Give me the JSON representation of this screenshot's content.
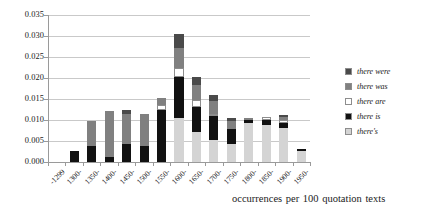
{
  "chart_data": {
    "type": "bar",
    "subtype": "stacked-bar",
    "title": "",
    "xlabel": "occurrences per 100 quotation texts",
    "ylabel": "",
    "ylim": [
      0.0,
      0.035
    ],
    "ytick_labels": [
      "0.035",
      "0.030",
      "0.025",
      "0.020",
      "0.015",
      "0.010",
      "0.005",
      "0.000"
    ],
    "ytick_values": [
      0.035,
      0.03,
      0.025,
      0.02,
      0.015,
      0.01,
      0.005,
      0.0
    ],
    "grid": true,
    "legend_position": "right",
    "categories": [
      "-1299",
      "1300-",
      "1350-",
      "1400-",
      "1450-",
      "1500-",
      "1550-",
      "1600-",
      "1650-",
      "1700-",
      "1750-",
      "1800-",
      "1850-",
      "1900-",
      "1950-"
    ],
    "series": [
      {
        "name": "there's",
        "color": "#d4d4d4",
        "values": [
          0.0,
          0.0,
          0.0,
          0.0,
          0.0,
          0.0,
          0.0,
          0.0105,
          0.0072,
          0.0052,
          0.0043,
          0.0092,
          0.0088,
          0.0082,
          0.0026
        ]
      },
      {
        "name": "there is",
        "color": "#111111",
        "values": [
          0.0,
          0.0026,
          0.0038,
          0.0013,
          0.0042,
          0.0039,
          0.0125,
          0.0097,
          0.006,
          0.0057,
          0.0036,
          0.0009,
          0.0012,
          0.0012,
          0.0004
        ]
      },
      {
        "name": "there are",
        "color": "#ffffff",
        "values": [
          0.0,
          0.0,
          0.0,
          0.0,
          0.0,
          0.0,
          0.0011,
          0.0021,
          0.0015,
          0.0005,
          0.0,
          0.0,
          0.0008,
          0.0006,
          0.0
        ]
      },
      {
        "name": "there was",
        "color": "#808080",
        "values": [
          0.0,
          0.0,
          0.006,
          0.0109,
          0.0072,
          0.0075,
          0.0016,
          0.0048,
          0.0036,
          0.0032,
          0.0019,
          0.0005,
          0.0,
          0.0008,
          0.0002
        ]
      },
      {
        "name": "there were",
        "color": "#4a4a4a",
        "values": [
          0.0,
          0.0,
          0.0,
          0.0,
          0.0009,
          0.0,
          0.0,
          0.0034,
          0.002,
          0.0014,
          0.0008,
          0.0,
          0.0,
          0.0004,
          0.0
        ]
      }
    ]
  },
  "legend": {
    "items": [
      {
        "label": "there were",
        "color": "#4a4a4a"
      },
      {
        "label": "there was",
        "color": "#808080"
      },
      {
        "label": "there are",
        "color": "#ffffff"
      },
      {
        "label": "there is",
        "color": "#111111"
      },
      {
        "label": "there's",
        "color": "#d4d4d4"
      }
    ]
  },
  "caption": {
    "text": "occurrences per 100 quotation texts"
  },
  "axis": {
    "grid_color": "#c9c9c9",
    "axis_color": "#9a9a9a"
  }
}
